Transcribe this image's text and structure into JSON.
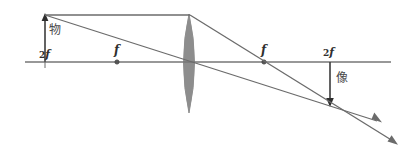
{
  "diagram": {
    "background_color": "#ffffff",
    "line_color": "#6b6b6b",
    "axis_color": "#767676",
    "lens_fill_color": "#8d8d8d",
    "label_color": "#3a3a3a",
    "labels": {
      "object": "物",
      "image": "像",
      "focal_left": "f",
      "focal_right": "f",
      "twice_focal_left_num": "2",
      "twice_focal_left_f": "f",
      "twice_focal_right_num": "2",
      "twice_focal_right_f": "f"
    },
    "optical_axis": {
      "x1": 25,
      "y": 62,
      "x2": 391
    },
    "lens": {
      "center_x": 189,
      "top_y": 14,
      "bottom_y": 113,
      "half_width": 11
    },
    "points": {
      "object_base": {
        "x": 45,
        "y": 62
      },
      "object_tip": {
        "x": 45,
        "y": 15
      },
      "focal_left": {
        "x": 117,
        "y": 62
      },
      "focal_right": {
        "x": 264,
        "y": 62
      },
      "twice_focal_left": {
        "x": 45,
        "y": 62
      },
      "twice_focal_right": {
        "x": 330,
        "y": 62
      },
      "image_base": {
        "x": 330,
        "y": 62
      },
      "image_tip": {
        "x": 330,
        "y": 106
      },
      "lens_center": {
        "x": 189,
        "y": 62
      }
    },
    "rays": [
      {
        "name": "parallel-ray-incident",
        "from": {
          "x": 45,
          "y": 15
        },
        "to": {
          "x": 189,
          "y": 15
        }
      },
      {
        "name": "parallel-ray-refracted",
        "from": {
          "x": 189,
          "y": 15
        },
        "to": {
          "x": 396,
          "y": 143
        }
      },
      {
        "name": "chief-ray",
        "from": {
          "x": 45,
          "y": 15
        },
        "to": {
          "x": 380,
          "y": 122
        }
      }
    ],
    "arrowheads": [
      {
        "name": "object-arrow-tip",
        "direction": "up"
      },
      {
        "name": "image-arrow-tip",
        "direction": "down"
      },
      {
        "name": "chief-ray-arrow",
        "direction": "down-right"
      },
      {
        "name": "parallel-ray-arrow",
        "direction": "down-right"
      }
    ]
  }
}
